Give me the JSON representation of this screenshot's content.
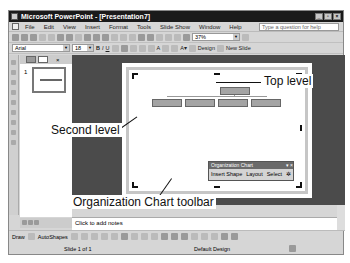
{
  "window": {
    "title": "Microsoft PowerPoint - [Presentation7]",
    "controls": [
      "minimize",
      "restore",
      "close"
    ]
  },
  "menubar": {
    "items": [
      "File",
      "Edit",
      "View",
      "Insert",
      "Format",
      "Tools",
      "Slide Show",
      "Window",
      "Help"
    ],
    "help_placeholder": "Type a question for help"
  },
  "toolbar": {
    "zoom": "37%",
    "font": "Arial",
    "font_size": "18",
    "design_label": "Design",
    "new_slide_label": "New Slide"
  },
  "slides_pane": {
    "slide_number": "1"
  },
  "org_chart_toolbar": {
    "title": "Organization Chart",
    "insert_shape": "Insert Shape",
    "layout": "Layout",
    "select": "Select"
  },
  "callouts": {
    "top_level": "Top level",
    "second_level": "Second level",
    "toolbar": "Organization Chart toolbar"
  },
  "notes": {
    "placeholder": "Click to add notes"
  },
  "drawbar": {
    "draw": "Draw",
    "autoshapes": "AutoShapes"
  },
  "statusbar": {
    "slide": "Slide 1 of 1",
    "design": "Default Design"
  }
}
